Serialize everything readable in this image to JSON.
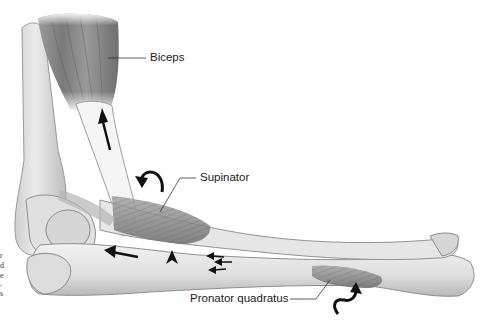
{
  "figure": {
    "labels": [
      {
        "id": "biceps",
        "text": "Biceps"
      },
      {
        "id": "supinator",
        "text": "Supinator"
      },
      {
        "id": "pronator-quadratus",
        "text": "Pronator quadratus"
      }
    ],
    "caption_fragments": [
      "r",
      "d",
      "e",
      ",",
      "s"
    ],
    "colors": {
      "background": "#ffffff",
      "bone": "#e4e4e4",
      "bone_shadow": "#a9a9a9",
      "muscle": "#8c8c8c",
      "tendon": "#f4f4f4",
      "arrow": "#111111",
      "text": "#1a1a1a"
    }
  }
}
